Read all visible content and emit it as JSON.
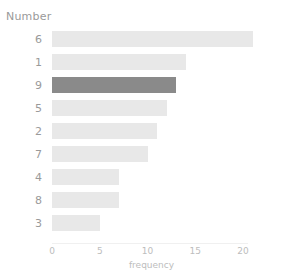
{
  "chart_data": {
    "type": "bar",
    "orientation": "horizontal",
    "title": "",
    "xlabel": "frequency",
    "ylabel": "Number",
    "categories": [
      "6",
      "1",
      "9",
      "5",
      "2",
      "7",
      "4",
      "8",
      "3"
    ],
    "values": [
      21,
      14,
      13,
      12,
      11,
      10,
      7,
      7,
      5
    ],
    "series": [
      {
        "name": "frequency",
        "values": [
          21,
          14,
          13,
          12,
          11,
          10,
          7,
          7,
          5
        ]
      }
    ],
    "highlighted_categories": [
      "9"
    ],
    "xlim": [
      0,
      22
    ],
    "xticks": [
      0,
      5,
      10,
      15,
      20
    ],
    "xtick_labels": [
      "0",
      "5",
      "10",
      "15",
      "20"
    ],
    "grid": false,
    "legend": false,
    "colors": {
      "bar": "#e8e8e8",
      "bar_highlight": "#8a8a8a",
      "axis_text": "#bdbdbd",
      "category_text": "#9a9a9a",
      "axis_title_text": "#9a9a9a",
      "axis_line": "#f0f0f0",
      "background": "#ffffff"
    }
  }
}
